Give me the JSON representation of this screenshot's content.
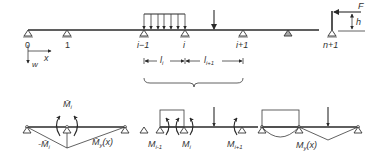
{
  "diagram": {
    "colors": {
      "line": "#2a2a2a",
      "background": "#ffffff"
    },
    "top_beam": {
      "support_labels": [
        "0",
        "1",
        "i−1",
        "i",
        "i+1",
        "n+1"
      ],
      "axes": {
        "x_label": "x",
        "w_label": "w"
      },
      "dimensions": [
        {
          "label": "l",
          "sub": "i"
        },
        {
          "label": "l",
          "sub": "i+1"
        }
      ],
      "force": {
        "label": "F",
        "height_label": "h"
      }
    },
    "bottom_left": {
      "moment_label": "M̄",
      "moment_sub": "i",
      "neg_moment_label": "-M̄",
      "neg_moment_sub": "i",
      "diagram_label": "M̄",
      "diagram_sub": "y",
      "diagram_arg": "(x)"
    },
    "bottom_middle": {
      "moments": [
        {
          "label": "M",
          "sub": "i-1"
        },
        {
          "label": "M",
          "sub": "i"
        },
        {
          "label": "M",
          "sub": "i+1"
        }
      ]
    },
    "bottom_right": {
      "diagram_label": "M",
      "diagram_sub": "y",
      "diagram_arg": "(x)"
    }
  }
}
